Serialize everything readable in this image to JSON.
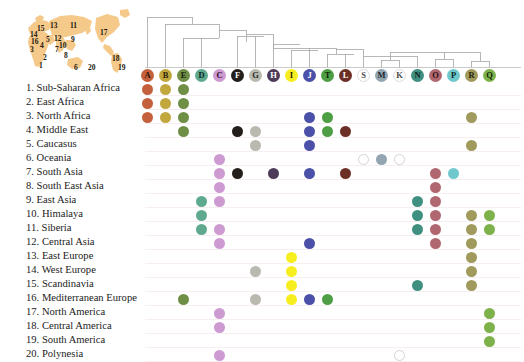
{
  "figure": {
    "type": "presence-absence matrix with phylogenetic tree and world map"
  },
  "map": {
    "name": "world-map",
    "land_color": "#f5c98a",
    "markers": [
      {
        "id": 1,
        "label": "1",
        "x": 31,
        "y": 58
      },
      {
        "id": 2,
        "label": "2",
        "x": 35,
        "y": 50
      },
      {
        "id": 3,
        "label": "3",
        "x": 22,
        "y": 42
      },
      {
        "id": 4,
        "label": "4",
        "x": 32,
        "y": 38
      },
      {
        "id": 5,
        "label": "5",
        "x": 38,
        "y": 32
      },
      {
        "id": 6,
        "label": "6",
        "x": 66,
        "y": 60
      },
      {
        "id": 7,
        "label": "7",
        "x": 47,
        "y": 42
      },
      {
        "id": 8,
        "label": "8",
        "x": 56,
        "y": 48
      },
      {
        "id": 9,
        "label": "9",
        "x": 63,
        "y": 32
      },
      {
        "id": 10,
        "label": "10",
        "x": 51,
        "y": 38
      },
      {
        "id": 11,
        "label": "11",
        "x": 62,
        "y": 18
      },
      {
        "id": 12,
        "label": "12",
        "x": 46,
        "y": 31
      },
      {
        "id": 13,
        "label": "13",
        "x": 42,
        "y": 18
      },
      {
        "id": 14,
        "label": "14",
        "x": 22,
        "y": 27
      },
      {
        "id": 15,
        "label": "15",
        "x": 29,
        "y": 21
      },
      {
        "id": 16,
        "label": "16",
        "x": 23,
        "y": 34
      },
      {
        "id": 17,
        "label": "17",
        "x": 92,
        "y": 25
      },
      {
        "id": 18,
        "label": "18",
        "x": 104,
        "y": 51
      },
      {
        "id": 19,
        "label": "19",
        "x": 110,
        "y": 60
      },
      {
        "id": 20,
        "label": "20",
        "x": 80,
        "y": 60
      }
    ]
  },
  "regions": [
    {
      "n": 1,
      "label": "1. Sub-Saharan Africa"
    },
    {
      "n": 2,
      "label": "2. East Africa"
    },
    {
      "n": 3,
      "label": "3. North Africa"
    },
    {
      "n": 4,
      "label": "4. Middle East"
    },
    {
      "n": 5,
      "label": "5. Caucasus"
    },
    {
      "n": 6,
      "label": "6. Oceania"
    },
    {
      "n": 7,
      "label": "7. South Asia"
    },
    {
      "n": 8,
      "label": "8.  South East Asia"
    },
    {
      "n": 9,
      "label": "9. East Asia"
    },
    {
      "n": 10,
      "label": "10. Himalaya"
    },
    {
      "n": 11,
      "label": "11. Siberia"
    },
    {
      "n": 12,
      "label": "12. Central Asia"
    },
    {
      "n": 13,
      "label": "13. East Europe"
    },
    {
      "n": 14,
      "label": "14. West Europe"
    },
    {
      "n": 15,
      "label": "15. Scandinavia"
    },
    {
      "n": 16,
      "label": "16. Mediterranean Europe"
    },
    {
      "n": 17,
      "label": "17. North America"
    },
    {
      "n": 18,
      "label": "18. Central America"
    },
    {
      "n": 19,
      "label": "19. South America"
    },
    {
      "n": 20,
      "label": "20. Polynesia"
    }
  ],
  "haplogroups": [
    {
      "letter": "A",
      "color": "#c4613c",
      "text_color": "#2a1208",
      "hollow": false
    },
    {
      "letter": "B",
      "color": "#c2a73f",
      "text_color": "#2a2408",
      "hollow": false
    },
    {
      "letter": "E",
      "color": "#6f8f47",
      "text_color": "#17220c",
      "hollow": false
    },
    {
      "letter": "D",
      "color": "#5fa98e",
      "text_color": "#0e241d",
      "hollow": false
    },
    {
      "letter": "C",
      "color": "#cd9ad2",
      "text_color": "#2a0f2e",
      "hollow": false
    },
    {
      "letter": "F",
      "color": "#231f1c",
      "text_color": "#ffffff",
      "hollow": false
    },
    {
      "letter": "G",
      "color": "#b9b9b0",
      "text_color": "#2a2a25",
      "hollow": false
    },
    {
      "letter": "H",
      "color": "#4e3a59",
      "text_color": "#ffffff",
      "hollow": false
    },
    {
      "letter": "I",
      "color": "#f7ee1f",
      "text_color": "#2a2705",
      "hollow": false
    },
    {
      "letter": "J",
      "color": "#4b50a8",
      "text_color": "#ffffff",
      "hollow": false
    },
    {
      "letter": "T",
      "color": "#4e9e45",
      "text_color": "#0f2309",
      "hollow": false
    },
    {
      "letter": "L",
      "color": "#6b2f25",
      "text_color": "#ffffff",
      "hollow": false
    },
    {
      "letter": "S",
      "color": "#ffffff",
      "text_color": "#4a4a4a",
      "hollow": true
    },
    {
      "letter": "M",
      "color": "#93a5b0",
      "text_color": "#1c262c",
      "hollow": false
    },
    {
      "letter": "K",
      "color": "#ffffff",
      "text_color": "#4a4a4a",
      "hollow": true
    },
    {
      "letter": "N",
      "color": "#3f9080",
      "text_color": "#0c201c",
      "hollow": false
    },
    {
      "letter": "O",
      "color": "#b0676f",
      "text_color": "#2b1013",
      "hollow": false
    },
    {
      "letter": "P",
      "color": "#6fc9cc",
      "text_color": "#0d2728",
      "hollow": false
    },
    {
      "letter": "R",
      "color": "#a09a5c",
      "text_color": "#232209",
      "hollow": false
    },
    {
      "letter": "Q",
      "color": "#7db14a",
      "text_color": "#16250b",
      "hollow": false
    }
  ],
  "chart_data": {
    "type": "heatmap",
    "xlabel": "Haplogroup",
    "ylabel": "Geographic region",
    "categories": [
      "A",
      "B",
      "E",
      "D",
      "C",
      "F",
      "G",
      "H",
      "I",
      "J",
      "T",
      "L",
      "S",
      "M",
      "K",
      "N",
      "O",
      "P",
      "R",
      "Q"
    ],
    "rows": [
      {
        "region": "1. Sub-Saharan Africa",
        "present": [
          "A",
          "B",
          "E"
        ]
      },
      {
        "region": "2. East Africa",
        "present": [
          "A",
          "B",
          "E"
        ]
      },
      {
        "region": "3. North Africa",
        "present": [
          "A",
          "B",
          "E",
          "J",
          "T",
          "R"
        ]
      },
      {
        "region": "4. Middle East",
        "present": [
          "E",
          "F",
          "G",
          "J",
          "T",
          "L"
        ]
      },
      {
        "region": "5. Caucasus",
        "present": [
          "G",
          "J",
          "R"
        ]
      },
      {
        "region": "6. Oceania",
        "present": [
          "C",
          "S",
          "M",
          "K"
        ]
      },
      {
        "region": "7. South Asia",
        "present": [
          "C",
          "F",
          "H",
          "J",
          "L",
          "O",
          "P"
        ]
      },
      {
        "region": "8.  South East Asia",
        "present": [
          "C",
          "O"
        ]
      },
      {
        "region": "9. East Asia",
        "present": [
          "D",
          "C",
          "N",
          "O"
        ]
      },
      {
        "region": "10. Himalaya",
        "present": [
          "D",
          "N",
          "O",
          "R",
          "Q"
        ]
      },
      {
        "region": "11. Siberia",
        "present": [
          "D",
          "C",
          "N",
          "O",
          "R",
          "Q"
        ]
      },
      {
        "region": "12. Central Asia",
        "present": [
          "C",
          "J",
          "O",
          "R"
        ]
      },
      {
        "region": "13. East Europe",
        "present": [
          "I",
          "R"
        ]
      },
      {
        "region": "14. West Europe",
        "present": [
          "G",
          "I",
          "R"
        ]
      },
      {
        "region": "15. Scandinavia",
        "present": [
          "I",
          "N",
          "R"
        ]
      },
      {
        "region": "16. Mediterranean Europe",
        "present": [
          "E",
          "G",
          "I",
          "J",
          "T"
        ]
      },
      {
        "region": "17. North America",
        "present": [
          "C",
          "Q"
        ]
      },
      {
        "region": "18. Central America",
        "present": [
          "C",
          "Q"
        ]
      },
      {
        "region": "19. South America",
        "present": [
          "Q"
        ]
      },
      {
        "region": "20. Polynesia",
        "present": [
          "C",
          "K"
        ]
      }
    ],
    "hollow_cells": [
      {
        "region": "6. Oceania",
        "haplogroup": "S"
      },
      {
        "region": "6. Oceania",
        "haplogroup": "K"
      },
      {
        "region": "20. Polynesia",
        "haplogroup": "K"
      }
    ],
    "grid": true,
    "legend": "none"
  },
  "tree": {
    "name": "phylogenetic-tree",
    "line_color": "#9d9d9d",
    "description": "Nested bracket dendrogram joining the 20 haplogroups, deepest split at A"
  }
}
